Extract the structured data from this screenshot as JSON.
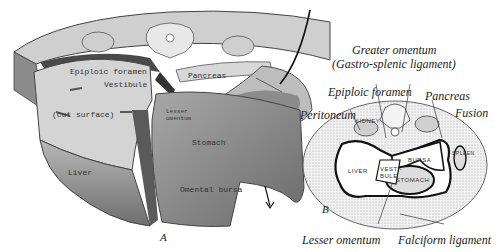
{
  "figure": {
    "panel_a": {
      "letter": "A",
      "labels": {
        "epiploic_foramen": "Epiploic foramen",
        "vestibule": "Vestibule",
        "pancreas": "Pancreas",
        "cut_surface": "(cut surface)",
        "lesser_omentum": "Lesser omentum",
        "stomach": "Stomach",
        "liver": "Liver",
        "omental_bursa": "Omental bursa"
      }
    },
    "panel_b": {
      "letter": "B",
      "inner_labels": {
        "kidney": "KIDNEY",
        "liver": "LIVER",
        "vestibule": "VESTI-BULE",
        "bursa": "BURSA",
        "stomach": "STOMACH",
        "spleen": "SPLEEN"
      }
    },
    "callouts": {
      "greater_omentum": "Greater omentum",
      "gastro_splenic": "(Gastro-splenic ligament)",
      "epiploic_foramen": "Epiploic foramen",
      "pancreas": "Pancreas",
      "peritoneum": "Peritoneum",
      "fusion": "Fusion",
      "lesser_omentum": "Lesser omentum",
      "falciform_ligament": "Falciform ligament"
    },
    "colors": {
      "ink": "#222222",
      "tissue_light": "#d9d9d9",
      "tissue_mid": "#9a9a9a",
      "tissue_dark": "#5a5a5a",
      "stipple": "#e6e6e6"
    }
  }
}
